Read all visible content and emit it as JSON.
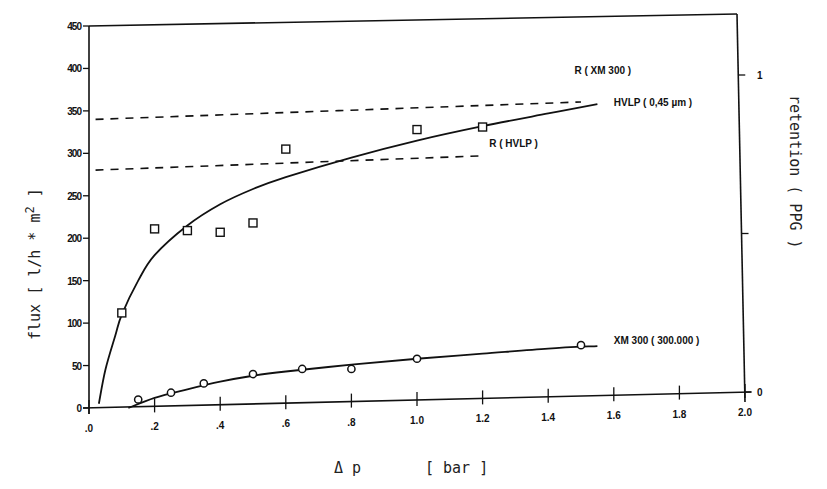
{
  "chart_data": {
    "type": "scatter",
    "title": "",
    "xlabel": "Δ p    [ bar ]",
    "ylabel": "flux   [ l/h * m2 ]",
    "y2label": "retention   ( PPG )",
    "xlim": [
      0.0,
      2.0
    ],
    "ylim": [
      0,
      450
    ],
    "y2lim": [
      0,
      1
    ],
    "grid": false,
    "legend_position": "inline annotations",
    "x_ticks": [
      ".0",
      ".2",
      ".4",
      ".6",
      ".8",
      "1.0",
      "1.2",
      "1.4",
      "1.6",
      "1.8",
      "2.0"
    ],
    "y_ticks": [
      "0",
      "50",
      "100",
      "150",
      "200",
      "250",
      "300",
      "350",
      "400",
      "450"
    ],
    "y2_ticks": [
      "0",
      "1"
    ],
    "series": [
      {
        "name": "HVLP ( 0,45 µm )",
        "marker": "square",
        "axis": "flux",
        "points": [
          {
            "x": 0.1,
            "y": 112
          },
          {
            "x": 0.2,
            "y": 211
          },
          {
            "x": 0.3,
            "y": 209
          },
          {
            "x": 0.4,
            "y": 207
          },
          {
            "x": 0.5,
            "y": 218
          },
          {
            "x": 0.6,
            "y": 305
          },
          {
            "x": 1.0,
            "y": 328
          },
          {
            "x": 1.2,
            "y": 331
          }
        ],
        "fit_curve": [
          {
            "x": 0.03,
            "y": 5
          },
          {
            "x": 0.05,
            "y": 45
          },
          {
            "x": 0.08,
            "y": 85
          },
          {
            "x": 0.1,
            "y": 110
          },
          {
            "x": 0.15,
            "y": 150
          },
          {
            "x": 0.2,
            "y": 180
          },
          {
            "x": 0.3,
            "y": 215
          },
          {
            "x": 0.4,
            "y": 240
          },
          {
            "x": 0.5,
            "y": 258
          },
          {
            "x": 0.6,
            "y": 272
          },
          {
            "x": 0.8,
            "y": 295
          },
          {
            "x": 1.0,
            "y": 315
          },
          {
            "x": 1.2,
            "y": 332
          },
          {
            "x": 1.4,
            "y": 347
          },
          {
            "x": 1.55,
            "y": 358
          }
        ]
      },
      {
        "name": "XM 300 ( 300.000 )",
        "marker": "circle",
        "axis": "flux",
        "points": [
          {
            "x": 0.15,
            "y": 10
          },
          {
            "x": 0.25,
            "y": 18
          },
          {
            "x": 0.35,
            "y": 29
          },
          {
            "x": 0.5,
            "y": 40
          },
          {
            "x": 0.65,
            "y": 46
          },
          {
            "x": 0.8,
            "y": 46
          },
          {
            "x": 1.0,
            "y": 58
          },
          {
            "x": 1.5,
            "y": 74
          }
        ],
        "fit_curve": [
          {
            "x": 0.12,
            "y": 0
          },
          {
            "x": 0.2,
            "y": 12
          },
          {
            "x": 0.3,
            "y": 22
          },
          {
            "x": 0.4,
            "y": 31
          },
          {
            "x": 0.5,
            "y": 38
          },
          {
            "x": 0.6,
            "y": 43
          },
          {
            "x": 0.8,
            "y": 51
          },
          {
            "x": 1.0,
            "y": 58
          },
          {
            "x": 1.2,
            "y": 64
          },
          {
            "x": 1.4,
            "y": 70
          },
          {
            "x": 1.55,
            "y": 73
          }
        ]
      },
      {
        "name": "R ( XM 300 )",
        "style": "dashed",
        "axis": "retention",
        "fit_curve": [
          {
            "x": 0.02,
            "y": 0.86
          },
          {
            "x": 1.5,
            "y": 0.915
          }
        ]
      },
      {
        "name": "R ( HVLP )",
        "style": "dashed",
        "axis": "retention",
        "fit_curve": [
          {
            "x": 0.02,
            "y": 0.7
          },
          {
            "x": 1.2,
            "y": 0.745
          }
        ]
      }
    ],
    "annotations": [
      {
        "text": "R ( XM 300 )",
        "x": 1.48,
        "y_flux": 398
      },
      {
        "text": "HVLP ( 0,45 µm )",
        "x": 1.6,
        "y_flux": 361
      },
      {
        "text": "R ( HVLP )",
        "x": 1.22,
        "y_flux": 312
      },
      {
        "text": "XM 300 ( 300.000 )",
        "x": 1.6,
        "y_flux": 80
      }
    ]
  },
  "axes": {
    "x_title_symbol": "Δ p",
    "x_title_unit": "[ bar ]",
    "y_title": "flux   [ l/h * m",
    "y_title_sup": "2",
    "y_title_end": " ]",
    "y2_title": "retention   ( PPG )"
  }
}
